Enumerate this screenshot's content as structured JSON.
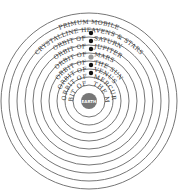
{
  "diagram": {
    "center": {
      "label": "EARTH",
      "color": "#777777"
    },
    "spheres": [
      {
        "label": "Orbit of the Moon",
        "of_text": "Orbit of",
        "body": "The Moon",
        "marker": "moon"
      },
      {
        "label": "Orbit of Mercury",
        "of_text": "Orbit of",
        "body": "Mercury",
        "marker": "dot"
      },
      {
        "label": "Orbit of Venus",
        "of_text": "Orbit of",
        "body": "Venus",
        "marker": "dot"
      },
      {
        "label": "Orbit of the Sun",
        "of_text": "Orbit of",
        "body": "The Sun",
        "marker": "sun"
      },
      {
        "label": "Orbit of Mars",
        "of_text": "Orbit of",
        "body": "Mars",
        "marker": "dot"
      },
      {
        "label": "Orbit of Jupiter",
        "of_text": "Orbit of",
        "body": "Jupiter",
        "marker": "dot"
      },
      {
        "label": "Orbit of Saturn",
        "of_text": "Orbit of",
        "body": "Saturn",
        "marker": "dot"
      },
      {
        "label": "Crystalline Heavens & Stars",
        "marker": "none"
      },
      {
        "label": "Primum Mobile",
        "marker": "none"
      }
    ],
    "colors": {
      "line": "#555555",
      "dot": "#111111",
      "sun": "#999999",
      "earth": "#777777"
    }
  },
  "labels": {
    "earth": "EARTH",
    "primum": "PRIMUM MOBILE",
    "crystalline": "CRYSTALLINE HEAVENS & STARS",
    "saturn_of": "ORBIT OF",
    "saturn": "SATURN",
    "jupiter_of": "ORBIT OF",
    "jupiter": "JUPITER",
    "mars_of": "ORBIT OF",
    "mars": "MARS",
    "sun_of": "ORBIT OF",
    "sun": "THE SUN",
    "venus_of": "ORBIT OF",
    "venus": "VENUS",
    "mercury_of": "ORBIT OF",
    "mercury": "MERCURY",
    "moon_of": "ORBIT OF",
    "moon": "THE MOON"
  }
}
